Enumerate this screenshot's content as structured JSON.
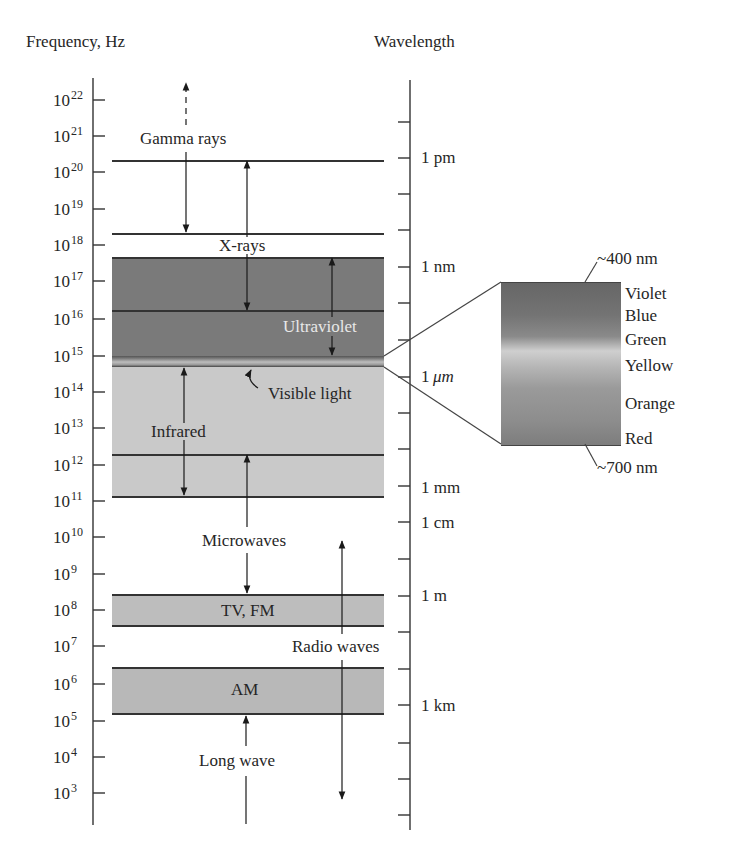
{
  "title_left": "Frequency, Hz",
  "title_right": "Wavelength",
  "frequency_ticks": [
    {
      "base": "10",
      "exp": "22"
    },
    {
      "base": "10",
      "exp": "21"
    },
    {
      "base": "10",
      "exp": "20"
    },
    {
      "base": "10",
      "exp": "19"
    },
    {
      "base": "10",
      "exp": "18"
    },
    {
      "base": "10",
      "exp": "17"
    },
    {
      "base": "10",
      "exp": "16"
    },
    {
      "base": "10",
      "exp": "15"
    },
    {
      "base": "10",
      "exp": "14"
    },
    {
      "base": "10",
      "exp": "13"
    },
    {
      "base": "10",
      "exp": "12"
    },
    {
      "base": "10",
      "exp": "11"
    },
    {
      "base": "10",
      "exp": "10"
    },
    {
      "base": "10",
      "exp": "9"
    },
    {
      "base": "10",
      "exp": "8"
    },
    {
      "base": "10",
      "exp": "7"
    },
    {
      "base": "10",
      "exp": "6"
    },
    {
      "base": "10",
      "exp": "5"
    },
    {
      "base": "10",
      "exp": "4"
    },
    {
      "base": "10",
      "exp": "3"
    }
  ],
  "wavelength_labels": {
    "pm": "1 pm",
    "nm": "1 nm",
    "um_num": "1",
    "um_unit": "μm",
    "mm": "1 mm",
    "cm": "1 cm",
    "m": "1 m",
    "km": "1 km"
  },
  "regions": {
    "gamma": "Gamma rays",
    "xray": "X-rays",
    "uv": "Ultraviolet",
    "visible": "Visible light",
    "ir": "Infrared",
    "microwave": "Microwaves",
    "tvfm": "TV, FM",
    "radio": "Radio waves",
    "am": "AM",
    "longwave": "Long wave"
  },
  "visible_spectrum": {
    "top_wavelength": "~400 nm",
    "bottom_wavelength": "~700 nm",
    "colors": [
      "Violet",
      "Blue",
      "Green",
      "Yellow",
      "Orange",
      "Red"
    ]
  }
}
